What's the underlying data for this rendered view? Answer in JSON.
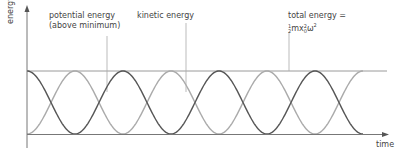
{
  "axes": {
    "y_label": "energy",
    "x_label": "time"
  },
  "labels": {
    "potential_line1": "potential energy",
    "potential_line2": "(above minimum)",
    "kinetic": "kinetic energy",
    "total_line1": "total energy =",
    "total_formula_num": "1",
    "total_formula_den": "2",
    "total_formula_m": "mx",
    "total_formula_exp1": "2",
    "total_formula_sub": "0",
    "total_formula_omega": "ω",
    "total_formula_exp2": "2"
  },
  "colors": {
    "potential": "#555555",
    "kinetic": "#aaaaaa",
    "total": "#999999",
    "axis": "#777777"
  },
  "chart_data": {
    "type": "line",
    "title": "",
    "xlabel": "time",
    "ylabel": "energy",
    "series": [
      {
        "name": "potential energy (above minimum)",
        "shape": "cos^2",
        "start": "max",
        "periods_shown": 3.5
      },
      {
        "name": "kinetic energy",
        "shape": "sin^2",
        "start": "min",
        "periods_shown": 3.5
      },
      {
        "name": "total energy = 1/2 m x0^2 ω^2",
        "shape": "constant",
        "value": "max"
      }
    ],
    "grid": false,
    "legend": "annotations with pointer lines"
  }
}
